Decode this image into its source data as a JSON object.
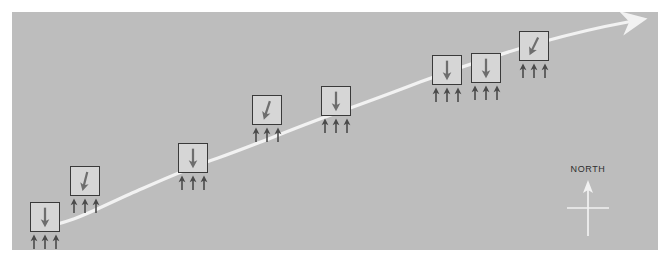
{
  "figure": {
    "title": "",
    "panel": {
      "background_color": "#bdbdbd",
      "page_background_color": "#ffffff",
      "x": 12,
      "y": 12,
      "width": 646,
      "height": 238
    },
    "trend_curve": {
      "name": "ascending-white-curve",
      "color": "#f2f2f2",
      "stroke_width": 3.2,
      "has_arrowhead": true,
      "arrowhead_direction": "up-right",
      "description": "white curved line ascending from lower-left to upper-right ending in an arrowhead",
      "path": "M 24 216 C 60 212, 86 196, 118 182 C 150 168, 176 156, 206 146 C 240 134, 268 122, 300 110 C 338 96, 372 84, 408 70 C 446 56, 488 42, 530 30 C 566 20, 594 14, 616 10",
      "arrow_tip": {
        "x": 625,
        "y": 8
      }
    },
    "stations": [
      {
        "id": "station-1",
        "label": "",
        "x": 18,
        "y": 190,
        "box_fill": "#d6d6d6",
        "box_border": "#3a3a3a",
        "down_arrow": {
          "tilt_deg": 0,
          "color": "#6e6e6e"
        },
        "up_arrows": {
          "count": 3,
          "color": "#4a4a4a"
        }
      },
      {
        "id": "station-2",
        "label": "",
        "x": 58,
        "y": 154,
        "box_fill": "#d6d6d6",
        "box_border": "#3a3a3a",
        "down_arrow": {
          "tilt_deg": 14,
          "color": "#6e6e6e"
        },
        "up_arrows": {
          "count": 3,
          "color": "#4a4a4a"
        }
      },
      {
        "id": "station-3",
        "label": "",
        "x": 166,
        "y": 131,
        "box_fill": "#d6d6d6",
        "box_border": "#3a3a3a",
        "down_arrow": {
          "tilt_deg": 0,
          "color": "#6e6e6e"
        },
        "up_arrows": {
          "count": 3,
          "color": "#4a4a4a"
        }
      },
      {
        "id": "station-4",
        "label": "",
        "x": 240,
        "y": 83,
        "box_fill": "#d6d6d6",
        "box_border": "#3a3a3a",
        "down_arrow": {
          "tilt_deg": 18,
          "color": "#6e6e6e"
        },
        "up_arrows": {
          "count": 3,
          "color": "#4a4a4a"
        }
      },
      {
        "id": "station-5",
        "label": "",
        "x": 309,
        "y": 74,
        "box_fill": "#d6d6d6",
        "box_border": "#3a3a3a",
        "down_arrow": {
          "tilt_deg": 0,
          "color": "#6e6e6e"
        },
        "up_arrows": {
          "count": 3,
          "color": "#4a4a4a"
        }
      },
      {
        "id": "station-6",
        "label": "",
        "x": 420,
        "y": 43,
        "box_fill": "#d6d6d6",
        "box_border": "#3a3a3a",
        "down_arrow": {
          "tilt_deg": 0,
          "color": "#6e6e6e"
        },
        "up_arrows": {
          "count": 3,
          "color": "#4a4a4a"
        }
      },
      {
        "id": "station-7",
        "label": "",
        "x": 459,
        "y": 41,
        "box_fill": "#d6d6d6",
        "box_border": "#3a3a3a",
        "down_arrow": {
          "tilt_deg": 0,
          "color": "#6e6e6e"
        },
        "up_arrows": {
          "count": 3,
          "color": "#4a4a4a"
        }
      },
      {
        "id": "station-8",
        "label": "",
        "x": 507,
        "y": 19,
        "box_fill": "#d6d6d6",
        "box_border": "#3a3a3a",
        "down_arrow": {
          "tilt_deg": 26,
          "color": "#6e6e6e"
        },
        "up_arrows": {
          "count": 3,
          "color": "#4a4a4a"
        }
      }
    ],
    "compass": {
      "label": "NORTH",
      "color": "#f2f2f2",
      "label_color": "#2e2e2e",
      "x": 548,
      "y": 152,
      "points_direction": "up"
    }
  }
}
